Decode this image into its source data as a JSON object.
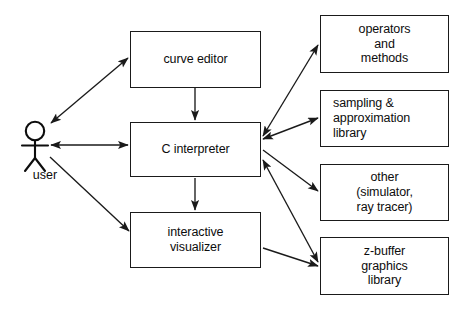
{
  "diagram": {
    "type": "system-architecture-block-diagram",
    "actor": {
      "name": "user-stick-figure",
      "label": "user"
    },
    "nodes": [
      {
        "id": "curve-editor",
        "label": "curve editor"
      },
      {
        "id": "c-interpreter",
        "label": "C interpreter"
      },
      {
        "id": "interactive-visualizer",
        "label": "interactive\nvisualizer"
      },
      {
        "id": "operators-methods",
        "label": "operators\nand\nmethods"
      },
      {
        "id": "sampling-library",
        "label": "sampling &\napproximation\nlibrary"
      },
      {
        "id": "other-simulator",
        "label": "other\n(simulator,\nray tracer)"
      },
      {
        "id": "zbuffer-library",
        "label": "z-buffer\ngraphics\nlibrary"
      }
    ],
    "edges": [
      {
        "from": "user",
        "to": "curve-editor",
        "arrow": "both"
      },
      {
        "from": "user",
        "to": "c-interpreter",
        "arrow": "both"
      },
      {
        "from": "user",
        "to": "interactive-visualizer",
        "arrow": "to"
      },
      {
        "from": "curve-editor",
        "to": "c-interpreter",
        "arrow": "to"
      },
      {
        "from": "c-interpreter",
        "to": "interactive-visualizer",
        "arrow": "to"
      },
      {
        "from": "c-interpreter",
        "to": "operators-methods",
        "arrow": "both"
      },
      {
        "from": "c-interpreter",
        "to": "sampling-library",
        "arrow": "both"
      },
      {
        "from": "c-interpreter",
        "to": "other-simulator",
        "arrow": "to"
      },
      {
        "from": "c-interpreter",
        "to": "zbuffer-library",
        "arrow": "both"
      },
      {
        "from": "interactive-visualizer",
        "to": "zbuffer-library",
        "arrow": "to"
      }
    ],
    "colors": {
      "stroke": "#1a1a1a",
      "text": "#0d0d0d",
      "background": "#ffffff"
    }
  }
}
